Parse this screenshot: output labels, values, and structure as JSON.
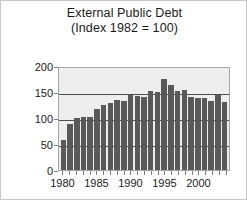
{
  "chart_data": {
    "type": "bar",
    "title": "External Public Debt",
    "subtitle": "(Index 1982 = 100)",
    "xlabel": "",
    "ylabel": "",
    "ylim": [
      0,
      200
    ],
    "yticks": [
      0,
      50,
      100,
      150,
      200
    ],
    "xticks": [
      1980,
      1985,
      1990,
      1995,
      2000
    ],
    "grid": true,
    "legend": false,
    "bar_color": "#595959",
    "plot_background": "#eeeeee",
    "categories": [
      "1980",
      "1981",
      "1982",
      "1983",
      "1984",
      "1985",
      "1986",
      "1987",
      "1988",
      "1989",
      "1990",
      "1991",
      "1992",
      "1993",
      "1994",
      "1995",
      "1996",
      "1997",
      "1998",
      "1999",
      "2000",
      "2001",
      "2002",
      "2003",
      "2004"
    ],
    "values": [
      57,
      88,
      100,
      101,
      102,
      118,
      125,
      128,
      135,
      132,
      145,
      143,
      140,
      152,
      150,
      175,
      163,
      152,
      153,
      140,
      138,
      138,
      133,
      145,
      130
    ]
  }
}
